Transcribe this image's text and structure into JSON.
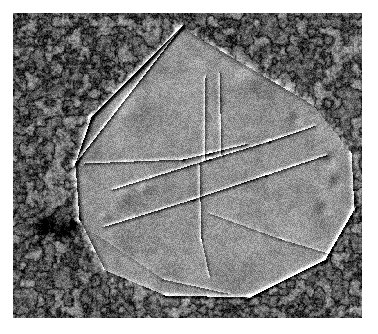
{
  "figure": {
    "kind": "electron-micrograph",
    "modality": "freeze-fracture transmission electron micrograph",
    "caption": "",
    "width": 378,
    "height": 334,
    "margin": {
      "left": 13,
      "top": 13,
      "right": 16,
      "bottom": 16
    },
    "plate": {
      "x": 13,
      "y": 13,
      "width": 349,
      "height": 305
    },
    "palette": {
      "paper": "#ffffff",
      "background_mean": "#8c8c8c",
      "crystal_mean": "#8f8f8f",
      "shadow_dark": "#232323",
      "highlight_light": "#ececec",
      "background_channel_dark": "#2e2e2e"
    },
    "rendering": {
      "grain_amplitude": 58,
      "background_reticulation_scale": 9,
      "crystal_lattice_period_px": 2.6,
      "crystal_lattice_amplitude": 26,
      "shadow_direction_deg": 135
    }
  },
  "scene": {
    "description": "A large faceted crystalline membrane patch (two-dimensional protein crystal) lying on a granular reticulated background matrix. The patch is bounded by straight facet edges and is subdivided by internal domain boundaries into several lattice domains. Shadowing runs from upper-left to lower-right giving each edge a dark line paired with a bright line.",
    "crystal_outline": [
      [
        168,
        14
      ],
      [
        300,
        92
      ],
      [
        338,
        140
      ],
      [
        341,
        196
      ],
      [
        312,
        246
      ],
      [
        236,
        284
      ],
      [
        152,
        282
      ],
      [
        92,
        257
      ],
      [
        66,
        206
      ],
      [
        62,
        150
      ],
      [
        78,
        104
      ]
    ],
    "domain_boundaries": [
      {
        "name": "upper-left-facet-edge",
        "points": [
          [
            168,
            14
          ],
          [
            62,
            150
          ]
        ]
      },
      {
        "name": "central-horizontal-boundary",
        "points": [
          [
            72,
            150
          ],
          [
            170,
            146
          ],
          [
            196,
            140
          ],
          [
            232,
            131
          ]
        ]
      },
      {
        "name": "median-diagonal-boundary",
        "points": [
          [
            100,
            176
          ],
          [
            196,
            146
          ],
          [
            256,
            128
          ],
          [
            300,
            113
          ]
        ]
      },
      {
        "name": "lower-median-boundary",
        "points": [
          [
            92,
            213
          ],
          [
            180,
            186
          ],
          [
            252,
            162
          ],
          [
            312,
            142
          ]
        ]
      },
      {
        "name": "vertical-domain-wall",
        "points": [
          [
            186,
            152
          ],
          [
            188,
            226
          ],
          [
            196,
            262
          ]
        ]
      },
      {
        "name": "lower-right-boundary",
        "points": [
          [
            196,
            200
          ],
          [
            268,
            226
          ],
          [
            318,
            241
          ]
        ]
      },
      {
        "name": "lower-left-boundary",
        "points": [
          [
            84,
            222
          ],
          [
            150,
            266
          ],
          [
            214,
            280
          ]
        ]
      },
      {
        "name": "upper-vertical-ridge-a",
        "points": [
          [
            192,
            64
          ],
          [
            191,
            146
          ]
        ]
      },
      {
        "name": "upper-vertical-ridge-b",
        "points": [
          [
            206,
            60
          ],
          [
            208,
            142
          ]
        ]
      }
    ],
    "features": [
      {
        "name": "dark-vesicle-large",
        "type": "blob",
        "x": 31,
        "y": 211,
        "r": 10
      },
      {
        "name": "dark-vesicle-medium",
        "type": "blob",
        "x": 50,
        "y": 216,
        "r": 8
      },
      {
        "name": "dark-vesicle-small",
        "type": "blob",
        "x": 59,
        "y": 210,
        "r": 5
      },
      {
        "name": "surface-bump-left",
        "type": "bump",
        "x": 112,
        "y": 182,
        "r": 9
      },
      {
        "name": "surface-bump-center",
        "type": "bump",
        "x": 131,
        "y": 176,
        "r": 6
      },
      {
        "name": "surface-bump-lower",
        "type": "bump",
        "x": 92,
        "y": 203,
        "r": 5
      },
      {
        "name": "edge-defect-right-a",
        "type": "pit",
        "x": 316,
        "y": 146,
        "r": 7
      },
      {
        "name": "edge-defect-right-b",
        "type": "pit",
        "x": 322,
        "y": 170,
        "r": 6
      },
      {
        "name": "edge-defect-right-c",
        "type": "pit",
        "x": 310,
        "y": 196,
        "r": 6
      },
      {
        "name": "edge-defect-top-right",
        "type": "pit",
        "x": 282,
        "y": 106,
        "r": 5
      },
      {
        "name": "bright-flake-top",
        "type": "flake",
        "x": 236,
        "y": 66,
        "r": 12
      },
      {
        "name": "bright-flake-upper-left",
        "type": "flake",
        "x": 120,
        "y": 96,
        "r": 14
      }
    ]
  }
}
